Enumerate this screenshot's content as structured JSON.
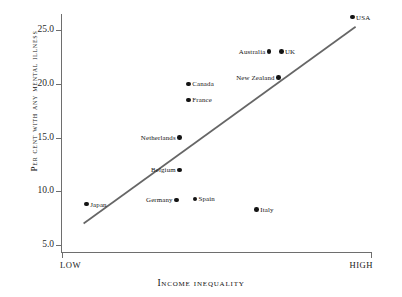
{
  "chart_data": {
    "type": "scatter",
    "title": "",
    "xlabel": "Income inequality",
    "ylabel": "Per cent with any mental illness",
    "xlim": [
      0,
      100
    ],
    "ylim": [
      4.0,
      27.0
    ],
    "grid": false,
    "legend": null,
    "x_tick_labels": [
      "LOW",
      "HIGH"
    ],
    "x_tick_values": [
      0,
      100
    ],
    "y_tick_labels": [
      "5.0",
      "10.0",
      "15.0",
      "20.0",
      "25.0"
    ],
    "y_tick_values": [
      5.0,
      10.0,
      15.0,
      20.0,
      25.0
    ],
    "points": [
      {
        "label": "Japan",
        "x": 8,
        "y": 8.8,
        "label_side": "right"
      },
      {
        "label": "Germany",
        "x": 37,
        "y": 9.2,
        "label_side": "left"
      },
      {
        "label": "Spain",
        "x": 43,
        "y": 9.3,
        "label_side": "right"
      },
      {
        "label": "Italy",
        "x": 63,
        "y": 8.3,
        "label_side": "right"
      },
      {
        "label": "Belgium",
        "x": 38,
        "y": 12.0,
        "label_side": "left"
      },
      {
        "label": "Netherlands",
        "x": 38,
        "y": 15.0,
        "label_side": "left"
      },
      {
        "label": "France",
        "x": 41,
        "y": 18.5,
        "label_side": "right"
      },
      {
        "label": "Canada",
        "x": 41,
        "y": 20.0,
        "label_side": "right"
      },
      {
        "label": "New Zealand",
        "x": 70,
        "y": 20.6,
        "label_side": "left"
      },
      {
        "label": "Australia",
        "x": 67,
        "y": 23.0,
        "label_side": "left"
      },
      {
        "label": "UK",
        "x": 71,
        "y": 23.0,
        "label_side": "right"
      },
      {
        "label": "USA",
        "x": 94,
        "y": 26.2,
        "label_side": "right"
      }
    ],
    "trend_line": {
      "x_start": 7,
      "y_start": 7.0,
      "x_end": 95,
      "y_end": 25.3,
      "color": "#666666"
    }
  },
  "style": {
    "axis_color": "#6e6e6e",
    "point_color": "#141414",
    "text_color": "#111111",
    "background": "#ffffff"
  }
}
